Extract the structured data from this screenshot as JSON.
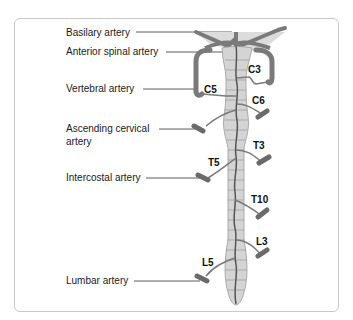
{
  "diagram": {
    "labels": {
      "basilary": "Basilary artery",
      "anterior_spinal": "Anterior spinal artery",
      "vertebral": "Vertebral artery",
      "ascending_cervical_1": "Ascending cervical",
      "ascending_cervical_2": "artery",
      "intercostal": "Intercostal artery",
      "lumbar": "Lumbar artery"
    },
    "segments": {
      "c3": "C3",
      "c5": "C5",
      "c6": "C6",
      "t3": "T3",
      "t5": "T5",
      "t10": "T10",
      "l3": "L3",
      "l5": "L5"
    },
    "colors": {
      "cord_fill": "#d4d4d4",
      "cord_lines": "#9a9a9a",
      "artery": "#7a7a7a",
      "artery_dark": "#555555",
      "frame_border": "#c9c9c9"
    }
  }
}
